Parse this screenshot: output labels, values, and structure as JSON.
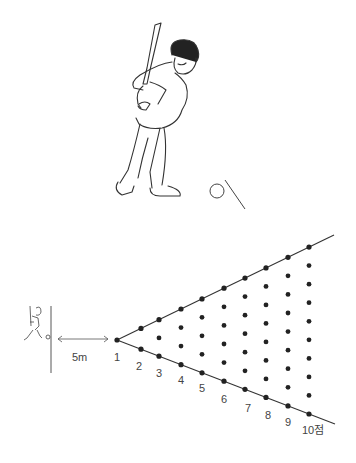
{
  "figure": {
    "top_illustration": "batter-swinging-at-ball-on-tee",
    "bottom_diagram": {
      "distance_label": "5m",
      "column_labels": [
        "1",
        "2",
        "3",
        "4",
        "5",
        "6",
        "7",
        "8",
        "9",
        "10점"
      ],
      "dots_per_column": [
        1,
        2,
        3,
        4,
        5,
        6,
        7,
        8,
        9,
        10
      ],
      "colors": {
        "ink": "#333333",
        "dot": "#222222",
        "background": "#ffffff"
      }
    }
  }
}
